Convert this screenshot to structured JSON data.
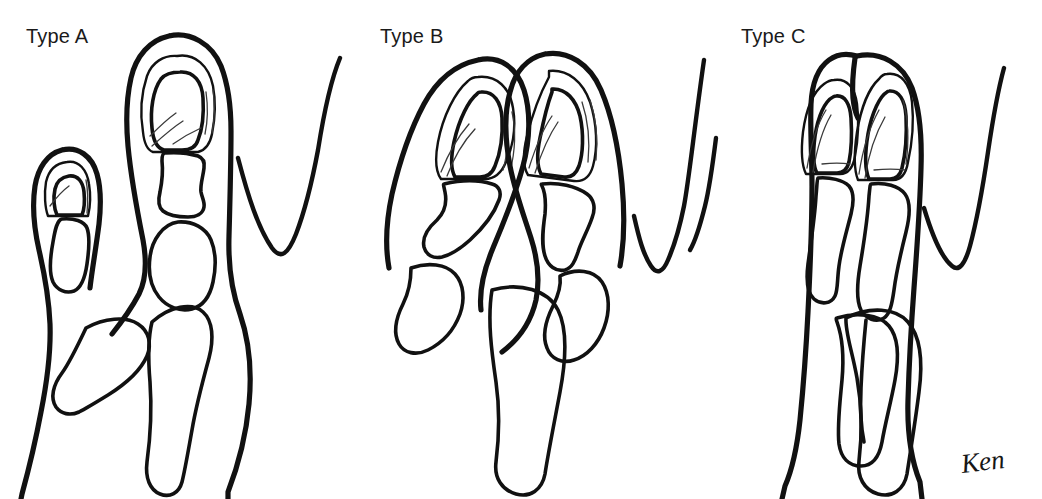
{
  "figure": {
    "background_color": "#ffffff",
    "ink_color": "#111111",
    "faded_header_text": "",
    "signature": "Ken"
  },
  "panels": [
    {
      "id": "type-a",
      "label": "Type A",
      "description": "Duplicated thumb with a small accessory radial digit branching from a common proximal phalanx; two nail plates on separate digits of unequal size.",
      "digit_count": 2,
      "nail_count": 2,
      "adjacent_finger_web": "right"
    },
    {
      "id": "type-b",
      "label": "Type B",
      "description": "Two equally sized duplicated digits splayed apart with a deep V-shaped cleft, arising from a single broad proximal phalanx.",
      "digit_count": 2,
      "nail_count": 2,
      "adjacent_finger_web": "right"
    },
    {
      "id": "type-c",
      "label": "Type C",
      "description": "Single broad digit bearing two conjoined nail plates at the tip with a bifid middle phalanx; shared common shaft.",
      "digit_count": 1,
      "nail_count": 2,
      "adjacent_finger_web": "both"
    }
  ],
  "legend": {
    "labels": [
      "Type A",
      "Type B",
      "Type C"
    ]
  }
}
